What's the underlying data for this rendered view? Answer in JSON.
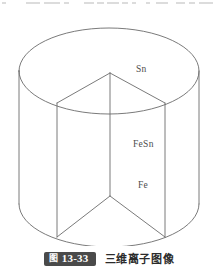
{
  "figure": {
    "title_badge_cn": "图",
    "title_badge_number": "13-33",
    "caption": "三维离子图像",
    "alt": "三维离子图像 — cut-away cylinder showing Sn, FeSn and Fe layers"
  },
  "colors": {
    "background": "#ffffff",
    "stroke": "#6b6b6b",
    "label_text": "#4d4d4d",
    "badge_background": "#4a4a4a",
    "badge_text": "#ffffff",
    "caption_text": "#2b2b2b"
  },
  "diagram": {
    "type": "cut-away-cylinder",
    "labels": [
      {
        "id": "sn",
        "text": "Sn",
        "layer": "top"
      },
      {
        "id": "fesn",
        "text": "FeSn",
        "layer": "middle"
      },
      {
        "id": "fe",
        "text": "Fe",
        "layer": "bottom"
      }
    ],
    "geometry": {
      "cylinder_left_x": 19,
      "cylinder_right_x": 199,
      "top_ellipse_center_y": 61,
      "ellipse_rx": 90,
      "ellipse_ry": 43,
      "bottom_ellipse_center_y": 194,
      "wedge_top_apex": [
        110,
        63
      ],
      "wedge_top_left_vertex": [
        57,
        93
      ],
      "wedge_top_right_vertex": [
        165,
        93
      ],
      "wedge_bottom_apex": [
        110,
        186
      ],
      "wedge_bottom_left_vertex": [
        57,
        227
      ],
      "wedge_bottom_right_vertex": [
        165,
        227
      ]
    }
  },
  "page_bleed": {
    "runs": [
      {
        "x": 2,
        "w": 4
      },
      {
        "x": 26,
        "w": 14
      },
      {
        "x": 44,
        "w": 16
      },
      {
        "x": 64,
        "w": 5
      },
      {
        "x": 84,
        "w": 10
      },
      {
        "x": 97,
        "w": 7
      },
      {
        "x": 107,
        "w": 12
      },
      {
        "x": 122,
        "w": 6
      },
      {
        "x": 132,
        "w": 4
      },
      {
        "x": 146,
        "w": 4
      },
      {
        "x": 156,
        "w": 12
      },
      {
        "x": 176,
        "w": 9
      },
      {
        "x": 189,
        "w": 6
      },
      {
        "x": 199,
        "w": 14
      }
    ]
  }
}
